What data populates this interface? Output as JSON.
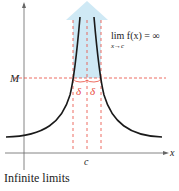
{
  "figure": {
    "caption": "Infinite limits",
    "formula_main": "lim f(x) = ∞",
    "formula_sub": "x→c",
    "labels": {
      "y_level": "M",
      "x_point": "c",
      "x_axis": "x",
      "delta_left": "δ",
      "delta_right": "δ"
    },
    "colors": {
      "curve": "#1a1a1a",
      "guide": "#e8473a",
      "shade": "#cfe9f5",
      "axis": "#555555"
    }
  }
}
